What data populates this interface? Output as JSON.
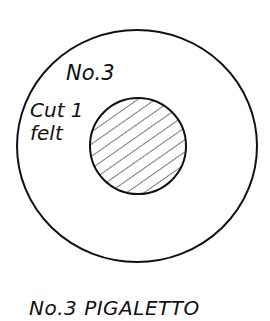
{
  "diagram": {
    "type": "sewing-pattern-piece",
    "piece_label": "No.3",
    "instruction_line1": "Cut 1",
    "instruction_line2": "felt",
    "caption": "No.3 PIGALETTO",
    "outer_shape": {
      "shape": "circle",
      "cx": 137,
      "cy": 146,
      "rx": 120,
      "ry": 116
    },
    "inner_shape": {
      "shape": "circle",
      "fill": "diagonal-hatch",
      "cx": 138,
      "cy": 146,
      "r": 48
    },
    "colors": {
      "stroke": "#111111",
      "background": "#ffffff",
      "hatch": "#222222"
    }
  }
}
